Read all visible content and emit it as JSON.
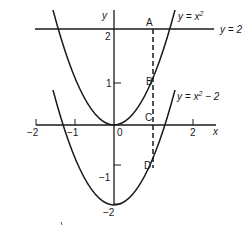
{
  "diagram": {
    "title": "",
    "axes": {
      "x_label": "x",
      "y_label": "y",
      "x_ticks": [
        {
          "value": -2,
          "label": "−2"
        },
        {
          "value": -1,
          "label": "−1"
        },
        {
          "value": 0,
          "label": "0"
        },
        {
          "value": 2,
          "label": "2"
        }
      ],
      "y_ticks": [
        {
          "value": 2,
          "label": "2"
        },
        {
          "value": 1,
          "label": "1"
        },
        {
          "value": -1,
          "label": "−1"
        },
        {
          "value": -2,
          "label": "−2"
        }
      ]
    },
    "curves": [
      {
        "name": "upper-parabola",
        "label": "y = x²",
        "label_base": "y = x",
        "exponent": "2"
      },
      {
        "name": "lower-parabola",
        "label": "y = x² − 2",
        "label_base": "y = x",
        "exponent": "2",
        "suffix": " − 2"
      },
      {
        "name": "horizontal-line",
        "label": "y = 2"
      }
    ],
    "points": [
      {
        "name": "A",
        "label": "A"
      },
      {
        "name": "B",
        "label": "B"
      },
      {
        "name": "C",
        "label": "C"
      },
      {
        "name": "D",
        "label": "D"
      }
    ],
    "dashed_line": {
      "x": 1
    },
    "colors": {
      "ink": "#1a1a1a",
      "background": "#ffffff"
    }
  }
}
